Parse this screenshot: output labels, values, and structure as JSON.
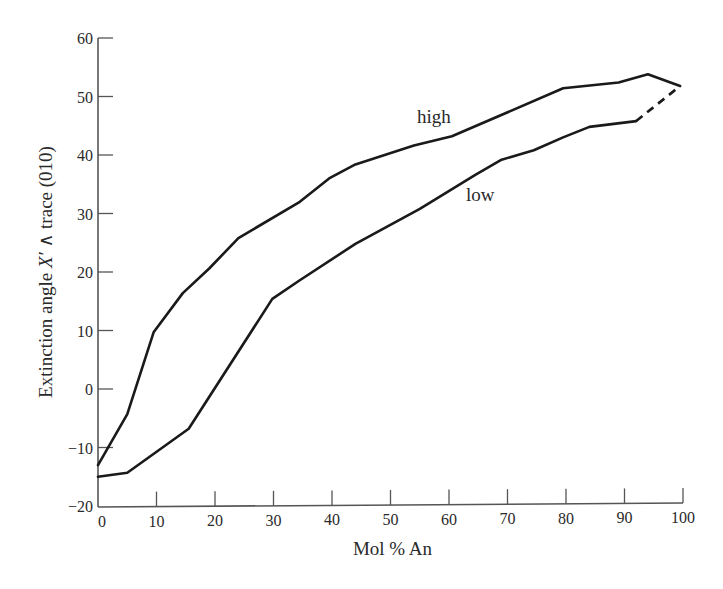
{
  "chart_data": {
    "type": "line",
    "title": "",
    "xlabel": "Mol % An",
    "ylabel_parts": {
      "prefix": "Extinction angle ",
      "symbol": "X′",
      "suffix": " ∧ trace (010)"
    },
    "ylabel": "Extinction angle X′ ∧ trace (010)",
    "xlim": [
      0,
      100
    ],
    "ylim": [
      -20,
      60
    ],
    "xticks": [
      0,
      10,
      20,
      30,
      40,
      50,
      60,
      70,
      80,
      90,
      100
    ],
    "yticks": [
      -20,
      -10,
      0,
      10,
      20,
      30,
      40,
      50,
      60
    ],
    "xtick_labels": [
      "0",
      "10",
      "20",
      "30",
      "40",
      "50",
      "60",
      "70",
      "80",
      "90",
      "100"
    ],
    "ytick_labels": [
      "−20",
      "−10",
      "0",
      "10",
      "20",
      "30",
      "40",
      "50",
      "60"
    ],
    "grid": false,
    "legend": "inline labels",
    "series": [
      {
        "name": "high",
        "style": "solid",
        "color": "#1a1a1a",
        "x": [
          0,
          5,
          9.5,
          14.5,
          19,
          24,
          34.5,
          39.5,
          44,
          54,
          60.5,
          79.5,
          89,
          94,
          99.5
        ],
        "y": [
          -13,
          -4.3,
          9.7,
          16.4,
          20.6,
          25.8,
          32,
          36,
          38.4,
          41.6,
          43.2,
          51.4,
          52.4,
          53.8,
          51.8
        ]
      },
      {
        "name": "low",
        "style": "solid",
        "color": "#1a1a1a",
        "x": [
          0,
          5,
          15.5,
          29.8,
          34.5,
          44,
          55,
          64.5,
          69,
          74.5,
          79.5,
          84,
          92
        ],
        "y": [
          -15,
          -14.3,
          -6.8,
          15.4,
          18.6,
          24.8,
          30.8,
          36.6,
          39.2,
          40.8,
          43,
          44.8,
          45.8
        ]
      },
      {
        "name": "low (extrapolated)",
        "style": "dashed",
        "color": "#1a1a1a",
        "x": [
          92,
          99.5
        ],
        "y": [
          45.8,
          51.8
        ]
      }
    ],
    "annotations": [
      {
        "text": "high",
        "x": 57,
        "y": 46.5
      },
      {
        "text": "low",
        "x": 63,
        "y": 32
      }
    ]
  },
  "labels": {
    "high": "high",
    "low": "low",
    "xlabel": "Mol % An"
  }
}
